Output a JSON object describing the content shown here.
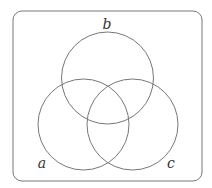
{
  "diagram": {
    "type": "venn",
    "universe": {
      "x": 13,
      "y": 11,
      "width": 189,
      "height": 170,
      "corner_radius": 9
    },
    "stroke_color": "#777777",
    "label_color": "#333333",
    "sets": [
      {
        "id": "a",
        "label": "a",
        "cx": 83.5,
        "cy": 124.5,
        "r": 45.5,
        "label_x": 42,
        "label_y": 168
      },
      {
        "id": "b",
        "label": "b",
        "cx": 107.5,
        "cy": 78,
        "r": 46,
        "label_x": 107,
        "label_y": 29
      },
      {
        "id": "c",
        "label": "c",
        "cx": 132.5,
        "cy": 124.5,
        "r": 45.5,
        "label_x": 171,
        "label_y": 168
      }
    ]
  }
}
